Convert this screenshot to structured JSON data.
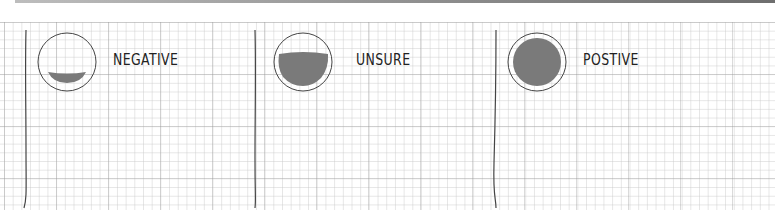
{
  "diagram": {
    "type": "sentiment-indicators",
    "colors": {
      "fill": "#7a7a7a",
      "outline": "#444444",
      "text": "#222222",
      "grid_major": "#b8b8b8",
      "grid_minor": "#dddddd"
    },
    "panels": [
      {
        "label": "NEGATIVE",
        "display_text": "NEGATIVE",
        "fill_level": "low"
      },
      {
        "label": "UNSURE",
        "display_text": "UNSURE",
        "fill_level": "half"
      },
      {
        "label": "POSTIVE",
        "display_text": "POSTIVE",
        "fill_level": "full"
      }
    ]
  }
}
